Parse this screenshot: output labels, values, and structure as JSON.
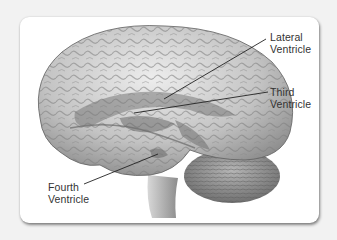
{
  "figure": {
    "labels": [
      {
        "id": "lateral",
        "line1": "Lateral",
        "line2": "Ventricle"
      },
      {
        "id": "third",
        "line1": "Third",
        "line2": "Ventricle"
      },
      {
        "id": "fourth",
        "line1": "Fourth",
        "line2": "Ventricle"
      }
    ],
    "colors": {
      "background": "#f2f2f2",
      "card": "#ffffff",
      "brain_light": "#e4e4e4",
      "brain_mid": "#a8a8a8",
      "brain_dark": "#6e6e6e",
      "ventricle": "#8a8a8a",
      "label_text": "#333333",
      "leader_line": "#222222"
    }
  }
}
